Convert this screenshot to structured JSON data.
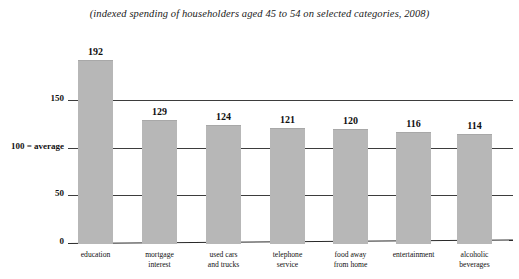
{
  "chart_data": {
    "type": "bar",
    "title": "(indexed spending of householders aged 45 to 54 on selected categories, 2008)",
    "xlabel": "",
    "ylabel": "",
    "ylim": [
      0,
      200
    ],
    "grid": true,
    "legend": "none",
    "yticks": [
      "0",
      "50",
      "100 = average",
      "150"
    ],
    "ytick_values": [
      0,
      50,
      100,
      150
    ],
    "categories": [
      "education",
      "mortgage\ninterest",
      "used cars\nand trucks",
      "telephone\nservice",
      "food away\nfrom home",
      "entertainment",
      "alcoholic\nbeverages"
    ],
    "values": [
      192,
      129,
      124,
      121,
      120,
      116,
      114
    ],
    "value_labels": [
      "192",
      "129",
      "124",
      "121",
      "120",
      "116",
      "114"
    ],
    "bar_color": "#b7b7b7",
    "axis_color": "#2a2a2a",
    "text_color": "#111111"
  }
}
